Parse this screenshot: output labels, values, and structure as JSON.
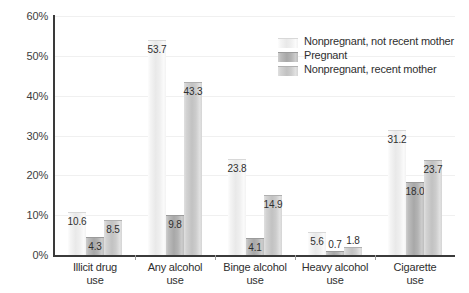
{
  "chart_data": {
    "type": "bar",
    "title": "",
    "xlabel": "",
    "ylabel": "",
    "ylim": [
      0,
      60
    ],
    "ytick_labels": [
      "0%",
      "10%",
      "20%",
      "30%",
      "40%",
      "50%",
      "60%"
    ],
    "ytick_values": [
      0,
      10,
      20,
      30,
      40,
      50,
      60
    ],
    "grid": true,
    "legend_position": "top-right",
    "categories": [
      "Illicit drug use",
      "Any alcohol use",
      "Binge alcohol use",
      "Heavy alcohol use",
      "Cigarette use"
    ],
    "category_lines": [
      [
        "Illicit drug",
        "use"
      ],
      [
        "Any alcohol",
        "use"
      ],
      [
        "Binge alcohol",
        "use"
      ],
      [
        "Heavy alcohol",
        "use"
      ],
      [
        "Cigarette",
        "use"
      ]
    ],
    "series": [
      {
        "name": "Nonpregnant, not recent mother",
        "color": "#ededed",
        "values": [
          10.6,
          53.7,
          23.8,
          5.6,
          31.2
        ],
        "labels": [
          "10.6",
          "53.7",
          "23.8",
          "5.6",
          "31.2"
        ]
      },
      {
        "name": "Pregnant",
        "color": "#adadad",
        "values": [
          4.3,
          9.8,
          4.1,
          0.7,
          18.0
        ],
        "labels": [
          "4.3",
          "9.8",
          "4.1",
          "0.7",
          "18.0"
        ]
      },
      {
        "name": "Nonpregnant, recent mother",
        "color": "#c8c8c8",
        "values": [
          8.5,
          43.3,
          14.9,
          1.8,
          23.7
        ],
        "labels": [
          "8.5",
          "43.3",
          "14.9",
          "1.8",
          "23.7"
        ]
      }
    ]
  },
  "legend": {
    "entries": [
      "Nonpregnant, not recent mother",
      "Pregnant",
      "Nonpregnant, recent mother"
    ]
  },
  "axis": {
    "y_labels": [
      "60%",
      "50%",
      "40%",
      "30%",
      "20%",
      "10%",
      "0%"
    ]
  }
}
